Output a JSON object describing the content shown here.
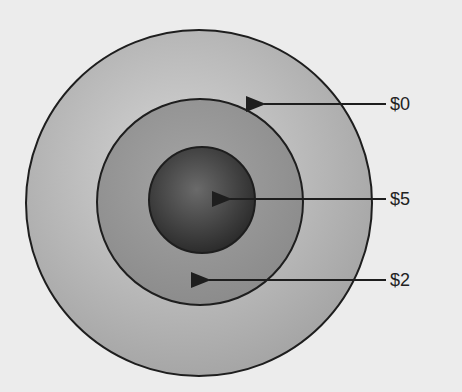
{
  "diagram": {
    "rings": [
      {
        "name": "outer",
        "label": "$0",
        "cx": 199,
        "cy": 203,
        "r": 173,
        "fill_light": "#d2d2d2",
        "fill_dark": "#a9a9a9"
      },
      {
        "name": "middle",
        "label": "$2",
        "cx": 200,
        "cy": 202,
        "r": 103,
        "fill_light": "#a8a8a8",
        "fill_dark": "#8a8a8a"
      },
      {
        "name": "inner",
        "label": "$5",
        "cx": 202,
        "cy": 200,
        "r": 53,
        "fill_light": "#6e6e6e",
        "fill_dark": "#2e2e2e"
      }
    ],
    "labels": [
      {
        "text": "$0",
        "x": 390,
        "y": 94,
        "arrow_from_x": 386,
        "arrow_to_x": 262,
        "arrow_y": 104
      },
      {
        "text": "$5",
        "x": 390,
        "y": 189,
        "arrow_from_x": 386,
        "arrow_to_x": 228,
        "arrow_y": 199
      },
      {
        "text": "$2",
        "x": 390,
        "y": 270,
        "arrow_from_x": 386,
        "arrow_to_x": 207,
        "arrow_y": 280
      }
    ],
    "background": "#ececec",
    "stroke": "#1e1e1e"
  }
}
